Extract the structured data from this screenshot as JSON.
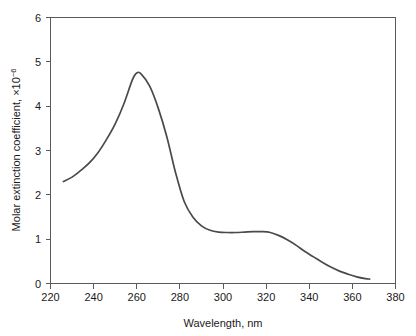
{
  "chart_data": {
    "type": "line",
    "title": "",
    "xlabel": "Wavelength, nm",
    "ylabel": "Molar extinction coefficient, ×10",
    "ylabel_exponent": "−6",
    "xlim": [
      220,
      380
    ],
    "ylim": [
      0,
      6
    ],
    "xticks": [
      220,
      240,
      260,
      280,
      300,
      320,
      340,
      360,
      380
    ],
    "xtick_labels": [
      "220",
      "240",
      "260",
      "280",
      "300",
      "320",
      "340",
      "360",
      "380"
    ],
    "yticks": [
      0,
      1,
      2,
      3,
      4,
      5,
      6
    ],
    "ytick_labels": [
      "0",
      "1",
      "2",
      "3",
      "4",
      "5",
      "6"
    ],
    "grid": false,
    "legend": false,
    "legend_position": "none",
    "line_color": "#4a4a4a",
    "axis_color": "#5a5a5a",
    "background_color": "#ffffff",
    "series": [
      {
        "name": "UV absorption spectrum",
        "x": [
          226,
          230,
          234,
          238,
          242,
          246,
          250,
          254,
          258,
          260,
          262,
          266,
          270,
          274,
          278,
          282,
          286,
          290,
          294,
          298,
          302,
          306,
          310,
          314,
          318,
          322,
          326,
          330,
          334,
          338,
          342,
          346,
          350,
          354,
          358,
          362,
          366,
          368
        ],
        "y": [
          2.3,
          2.4,
          2.55,
          2.72,
          2.95,
          3.25,
          3.6,
          4.05,
          4.6,
          4.75,
          4.73,
          4.45,
          3.95,
          3.3,
          2.5,
          1.85,
          1.5,
          1.3,
          1.2,
          1.16,
          1.15,
          1.15,
          1.16,
          1.17,
          1.17,
          1.15,
          1.08,
          0.98,
          0.86,
          0.72,
          0.6,
          0.48,
          0.37,
          0.28,
          0.21,
          0.15,
          0.11,
          0.1
        ]
      }
    ],
    "annotations": {
      "peak_wavelength_nm": 260,
      "peak_value": 4.75,
      "shoulder_wavelength_nm": 315,
      "shoulder_value": 1.17,
      "start_wavelength_nm": 226,
      "start_value": 2.3,
      "end_wavelength_nm": 368,
      "end_value": 0.1
    }
  }
}
